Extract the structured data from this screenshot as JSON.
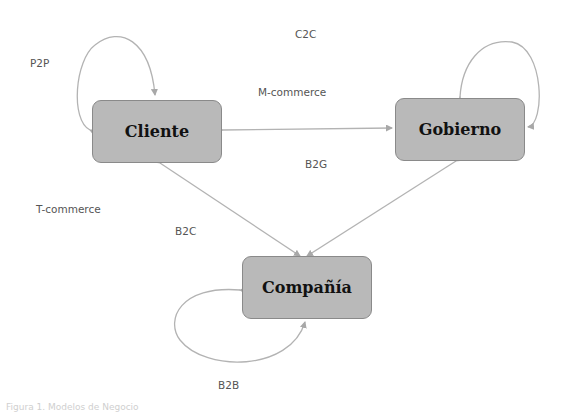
{
  "diagram": {
    "nodes": [
      {
        "id": "cliente",
        "label": "Cliente"
      },
      {
        "id": "gobierno",
        "label": "Gobierno"
      },
      {
        "id": "compania",
        "label": "Compañía"
      }
    ],
    "labels": {
      "p2p": "P2P",
      "c2c": "C2C",
      "m_commerce": "M-commerce",
      "b2g": "B2G",
      "t_commerce": "T-commerce",
      "b2c": "B2C",
      "b2b": "B2B"
    },
    "edges": [
      {
        "from": "cliente",
        "to": "cliente",
        "type": "self-loop"
      },
      {
        "from": "gobierno",
        "to": "gobierno",
        "type": "self-loop"
      },
      {
        "from": "compania",
        "to": "compania",
        "type": "self-loop"
      },
      {
        "from": "cliente",
        "to": "gobierno",
        "type": "bidirectional"
      },
      {
        "from": "cliente",
        "to": "compania",
        "type": "bidirectional"
      },
      {
        "from": "gobierno",
        "to": "compania",
        "type": "bidirectional"
      }
    ],
    "caption": "Figura 1. Modelos de Negocio"
  },
  "colors": {
    "node_fill": "#b9b9b9",
    "node_border": "#8a8a8a",
    "edge": "#b0b0b0",
    "label": "#555555"
  }
}
